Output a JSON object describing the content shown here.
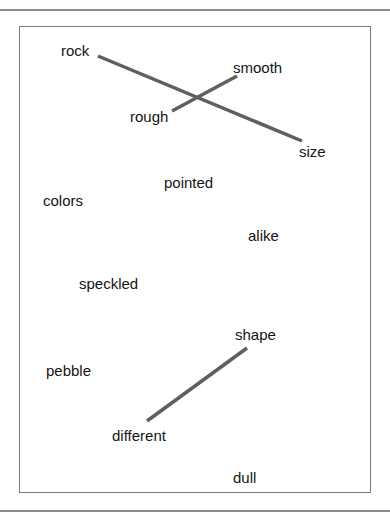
{
  "diagram": {
    "type": "word-matching-worksheet",
    "words": [
      {
        "id": "rock",
        "text": "rock",
        "x": 61,
        "y": 42
      },
      {
        "id": "smooth",
        "text": "smooth",
        "x": 233,
        "y": 59
      },
      {
        "id": "rough",
        "text": "rough",
        "x": 130,
        "y": 108
      },
      {
        "id": "size",
        "text": "size",
        "x": 299,
        "y": 143
      },
      {
        "id": "pointed",
        "text": "pointed",
        "x": 164,
        "y": 174
      },
      {
        "id": "colors",
        "text": "colors",
        "x": 43,
        "y": 192
      },
      {
        "id": "alike",
        "text": "alike",
        "x": 248,
        "y": 227
      },
      {
        "id": "speckled",
        "text": "speckled",
        "x": 79,
        "y": 275
      },
      {
        "id": "shape",
        "text": "shape",
        "x": 235,
        "y": 326
      },
      {
        "id": "pebble",
        "text": "pebble",
        "x": 46,
        "y": 362
      },
      {
        "id": "different",
        "text": "different",
        "x": 112,
        "y": 427
      },
      {
        "id": "dull",
        "text": "dull",
        "x": 233,
        "y": 469
      }
    ],
    "connections": [
      {
        "from": "rock",
        "to": "size",
        "x1": 98,
        "y1": 56,
        "x2": 302,
        "y2": 141
      },
      {
        "from": "rough",
        "to": "smooth",
        "x1": 172,
        "y1": 111,
        "x2": 237,
        "y2": 76
      },
      {
        "from": "shape",
        "to": "different",
        "x1": 247,
        "y1": 348,
        "x2": 147,
        "y2": 421
      }
    ],
    "colors": {
      "line": "#5f5f5f",
      "border": "#7a7a7a",
      "text": "#141414"
    }
  }
}
